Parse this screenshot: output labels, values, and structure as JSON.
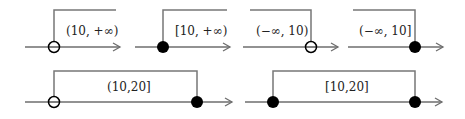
{
  "colors": {
    "axis": "#6e6e6e",
    "bracket": "#777777",
    "dot": "#000000",
    "label": "#222222"
  },
  "diagrams": [
    {
      "label": "(10, +∞)",
      "description": "open at 10, extends right"
    },
    {
      "label": "[10, +∞)",
      "description": "closed at 10, extends right"
    },
    {
      "label": "(−∞, 10)",
      "description": "extends left, open at 10"
    },
    {
      "label": "(−∞, 10]",
      "description": "extends left, closed at 10"
    },
    {
      "label": "(10,20]",
      "description": "open at 10, closed at 20"
    },
    {
      "label": "[10,20]",
      "description": "closed at 10, closed at 20"
    }
  ]
}
